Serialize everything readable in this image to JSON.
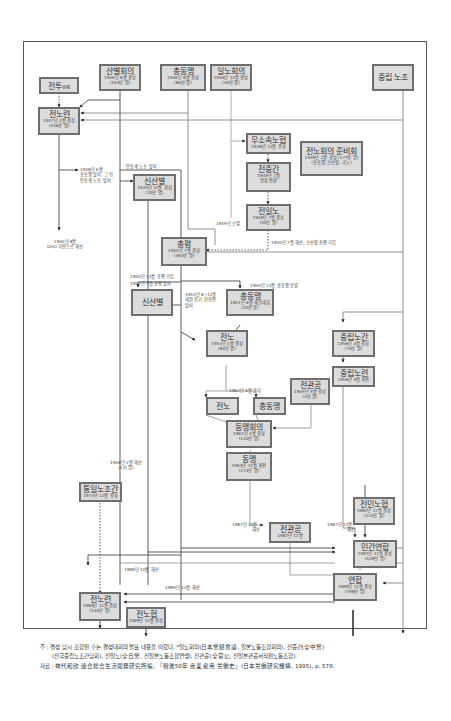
{
  "diagram": {
    "nodes": {
      "jeontu": {
        "name": "전투",
        "sub": "全鬪"
      },
      "sanbyeol": {
        "name": "산별회의",
        "line1": "1946년 8월 결성",
        "line2": "(163만 명)"
      },
      "chongdongmaeng_1946": {
        "name": "총동맹",
        "line1": "1946년 8월 결성",
        "line2": "(86만 명)"
      },
      "ilnohoeui": {
        "name": "일노회의",
        "line1": "1946년 10월 결성",
        "line2": "(30만 명)"
      },
      "jungrip_nojo": {
        "name": "중립 노조"
      },
      "jeonnoryeon_1947": {
        "name": "전노련",
        "line1": "1947년 3월 결성",
        "line2": "(446만 명)"
      },
      "musosok_nohyeop": {
        "name": "무소속노협",
        "line1": "1948년 12월 결성"
      },
      "jeonnohoeui_junbi": {
        "name": "전노회의 준비회",
        "line1": "1949년 2월 결성 (177만 명)",
        "line2": "(총동맹, 신산별, 국노)"
      },
      "jeonjunggan": {
        "name": "전중간",
        "line1": "1949년 2월",
        "line2": "명칭 변경"
      },
      "sinsanbyeol_1949": {
        "name": "신산별",
        "line1": "1949년 12월 결성",
        "line2": "(33만 명)"
      },
      "jeonilno": {
        "name": "전일노",
        "line1": "1949년 7월 결성",
        "line2": "(50만 명)"
      },
      "chonghyeong": {
        "name": "총평",
        "line1": "1950년 7월 결성",
        "line2": "(365만 명)"
      },
      "sinsanbyeol_2": {
        "name": "신산별"
      },
      "chongdongmaeng_1951": {
        "name": "총동맹",
        "line1": "1951년 6월 재건대회",
        "line2": "(33만 명)"
      },
      "jeonno_1954": {
        "name": "전노",
        "line1": "1954년 4월 결성",
        "line2": "(84만 명)"
      },
      "jungrip_nogan": {
        "name": "중립노간",
        "line1": "1956년 4월 결성",
        "line2": "(75만 명)"
      },
      "jungrip_noryeon": {
        "name": "중립노련",
        "line1": "1956년 9월 개편"
      },
      "jeongwangong_1959": {
        "name": "전관공",
        "line1": "1959년 9월 결성",
        "line2": "(4만 명)"
      },
      "jeonno_2": {
        "name": "전노"
      },
      "chongdongmaeng_2": {
        "name": "총동맹"
      },
      "dongmaeng_hoeui": {
        "name": "동맹회의",
        "line1": "1962년 4월 결성",
        "line2": "(140만 명)"
      },
      "dongmaeng": {
        "name": "동맹",
        "line1": "1964년 11월 개편",
        "line2": "(174만 명)"
      },
      "jeonmin_nohyeop": {
        "name": "전민노협",
        "line1": "1982년 12월 결성",
        "line2": "(425만 명)"
      },
      "tongil_nojogan": {
        "name": "통일노조간",
        "line1": "1974년 12월 결성"
      },
      "jeongwangong_1987": {
        "name": "전관공",
        "line1": "1987년 11월"
      },
      "mingan_yeonhap": {
        "name": "민간연합",
        "line1": "1987년 11월 결성",
        "line2": "(539만 명)"
      },
      "yeonhap": {
        "name": "연합",
        "line1": "1989년 11월 결성",
        "line2": "(798만 명)"
      },
      "jeonnoryeon_1989": {
        "name": "전노련",
        "line1": "1989년 11월 결성",
        "line2": "(140만 명)"
      },
      "jeonnohyeop": {
        "name": "전노협",
        "line1": "1989년 12월 결성"
      }
    },
    "labels": {
      "l_1948_6": [
        "1948년 6월",
        "총동맹 탈퇴, 그 뒤",
        "민동계 노조 탈퇴"
      ],
      "l_mindong": "민동계 노조 탈퇴",
      "l_1950_8": [
        "1950년 8월",
        "GHQ 지령으로 해산"
      ],
      "l_1949_disappear": "1949년 소멸",
      "l_1950_7": "1950년 7월 해산, 신산별 총평 가입",
      "l_1950_11_join": "1950년 11월 총평 가입",
      "l_1952_7": "1952년 7월 총평 탈퇴",
      "l_1950_11_split": "1950년 11월 총동맹 분열",
      "l_1953": [
        "1953년 8~11월",
        "해원·전기·전영련",
        "탈퇴"
      ],
      "l_1962_4": "1962년 4월 분리",
      "l_1958_2": [
        "1958년 2월 해산",
        "(1만 명)"
      ],
      "l_1987_11_a": [
        "1987년 11월",
        "해산"
      ],
      "l_1987_11_b": [
        "1987년 11월",
        "해산"
      ],
      "l_1988_10": "1988년 10월 해산",
      "l_1989_11": "1989년 11월 해산"
    },
    "notes": {
      "line1": "주 : 결성 당시 조합원 수는 결성대회의 발표 내용을 따랐다. *일노회의(日本勞組會議, 일본노동조합회의), 전중간(全中勞)",
      "line2": "(전국중립노조간담회), 전일노(全日勞, 전일본노동조합연맹), 전관공(全官公, 전일본관공서직원노동조합).",
      "line3": "자료 : 神代和欣·連合総合生活開発研究所編, 『戦後50年 産業·雇用·労働史』(日本労働研究機構, 1995), p. 578."
    }
  }
}
